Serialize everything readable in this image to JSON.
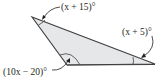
{
  "diagram": {
    "type": "triangle",
    "fill_color": "#e6e7e8",
    "stroke_color": "#414042",
    "vertices": {
      "top_left": [
        32,
        17
      ],
      "bottom": [
        67,
        65
      ],
      "right": [
        155,
        64
      ]
    },
    "angles": [
      {
        "vertex": "top_left",
        "label": "(x + 15)°"
      },
      {
        "vertex": "right",
        "label": "(x + 5)°"
      },
      {
        "vertex": "bottom",
        "label": "(10x − 20)°"
      }
    ]
  }
}
